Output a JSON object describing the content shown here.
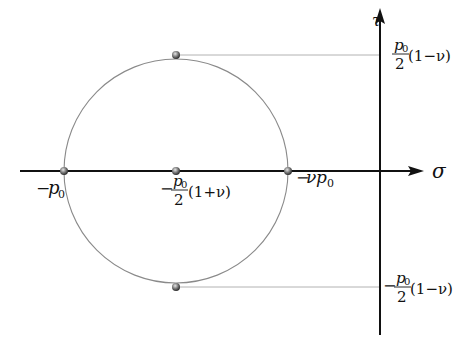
{
  "diagram": {
    "type": "mohr-circle",
    "axes": {
      "horizontal": {
        "label": "σ"
      },
      "vertical": {
        "label": "τ"
      }
    },
    "points": {
      "left": {
        "label_sign": "−",
        "label_var": "p",
        "label_sub": "0"
      },
      "center": {
        "label_sign": "−",
        "frac_num": "p",
        "frac_num_sub": "0",
        "frac_den": "2",
        "suffix": "(1+ν)"
      },
      "right": {
        "label_sign": "−",
        "label_coef": "ν",
        "label_var": "p",
        "label_sub": "0"
      }
    },
    "tau_labels": {
      "top": {
        "sign": "",
        "frac_num": "p",
        "frac_num_sub": "0",
        "frac_den": "2",
        "suffix": "(1−ν)"
      },
      "bottom": {
        "sign": "−",
        "frac_num": "p",
        "frac_num_sub": "0",
        "frac_den": "2",
        "suffix": "(1−ν)"
      }
    },
    "colors": {
      "axis": "#111111",
      "circle": "#8a8a8a",
      "guide": "#9a9a9a",
      "point": "#555555"
    }
  }
}
